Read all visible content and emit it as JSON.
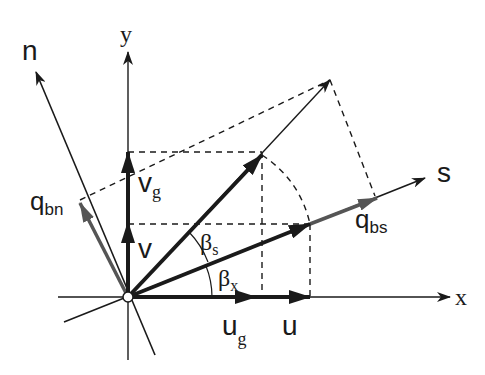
{
  "diagram": {
    "title": "",
    "colors": {
      "ink": "#1a1a1a",
      "gray_arrow": "#555555",
      "background": "#ffffff"
    },
    "axes": {
      "x": {
        "label": "x"
      },
      "y": {
        "label": "y"
      },
      "s": {
        "label": "s"
      },
      "n": {
        "label": "n"
      }
    },
    "vectors": {
      "u": {
        "label": "u"
      },
      "ug": {
        "label": "u",
        "sub": "g"
      },
      "v": {
        "label": "v"
      },
      "vg": {
        "label": "v",
        "sub": "g"
      },
      "qbs": {
        "label": "q",
        "sub": "bs"
      },
      "qbn": {
        "label": "q",
        "sub": "bn"
      }
    },
    "angles": {
      "beta_s": {
        "label": "β",
        "sub": "s"
      },
      "beta_x": {
        "label": "β",
        "sub": "x"
      }
    }
  }
}
